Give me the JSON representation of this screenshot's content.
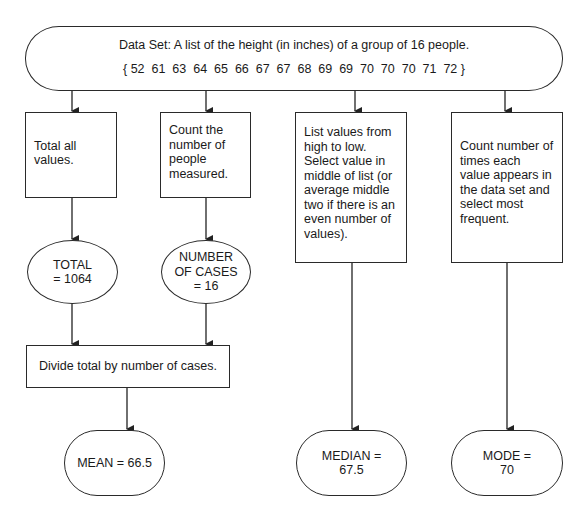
{
  "dataset": {
    "title": "Data Set:  A list of the height (in inches) of a group of 16 people.",
    "values_text": "{ 52  61  63  64  65  66  67  67  68  69  69  70  70  70  71  72 }",
    "values": [
      52,
      61,
      63,
      64,
      65,
      66,
      67,
      67,
      68,
      69,
      69,
      70,
      70,
      70,
      71,
      72
    ]
  },
  "steps": {
    "total": {
      "lines": [
        "Total all",
        "values."
      ]
    },
    "count": {
      "lines": [
        "Count the",
        "number of",
        "people",
        "measured."
      ]
    },
    "median": {
      "lines": [
        "List values from",
        "high to low.",
        "Select value in",
        "middle of list (or",
        "average middle",
        "two if there is an",
        "even number of",
        "values)."
      ]
    },
    "mode": {
      "lines": [
        "Count number of",
        "times each",
        "value appears in",
        "the data set and",
        "select most",
        "frequent."
      ]
    },
    "divide": {
      "label": "Divide total by number of cases."
    }
  },
  "intermediate": {
    "total": {
      "lines": [
        "TOTAL",
        "= 1064"
      ]
    },
    "cases": {
      "lines": [
        "NUMBER",
        "OF CASES",
        "= 16"
      ]
    }
  },
  "results": {
    "mean": {
      "lines": [
        "MEAN = 66.5"
      ]
    },
    "median": {
      "lines": [
        "MEDIAN =",
        "67.5"
      ]
    },
    "mode": {
      "lines": [
        "MODE =",
        "70"
      ]
    }
  }
}
